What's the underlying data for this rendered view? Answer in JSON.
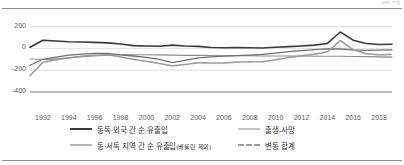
{
  "unit_note": "(단위: 천 명)",
  "chart_data": {
    "type": "line",
    "title": "",
    "xlabel": "",
    "ylabel": "",
    "ylim": [
      -400,
      260
    ],
    "xlim": [
      1991,
      2019
    ],
    "grid": true,
    "legend_position": "bottom",
    "yticks": [
      200,
      0,
      -200,
      -400
    ],
    "ytick_labels": [
      "200",
      "0",
      "-200",
      "-400"
    ],
    "xticks": [
      1992,
      1994,
      1996,
      1998,
      2000,
      2002,
      2004,
      2006,
      2008,
      2010,
      2012,
      2014,
      2016,
      2018
    ],
    "xtick_labels": [
      "1992",
      "1994",
      "1996",
      "1998",
      "2000",
      "2002",
      "2004",
      "2006",
      "2008",
      "2010",
      "2012",
      "2014",
      "2016",
      "2018"
    ],
    "x": [
      1991,
      1992,
      1993,
      1994,
      1995,
      1996,
      1997,
      1998,
      1999,
      2000,
      2001,
      2002,
      2003,
      2004,
      2005,
      2006,
      2007,
      2008,
      2009,
      2010,
      2011,
      2012,
      2013,
      2014,
      2015,
      2016,
      2017,
      2018,
      2019
    ],
    "series": [
      {
        "name": "동독·외국 간 순 유출입",
        "color": "#3a3a3a",
        "style": "solid",
        "width": 1.6,
        "values": [
          10,
          75,
          68,
          60,
          58,
          55,
          50,
          40,
          25,
          22,
          20,
          30,
          22,
          18,
          8,
          5,
          8,
          6,
          4,
          10,
          16,
          22,
          30,
          45,
          150,
          75,
          45,
          35,
          38
        ]
      },
      {
        "name": "출생-사망",
        "color": "#8c8c8c",
        "style": "solid",
        "width": 1.1,
        "values": [
          -98,
          -102,
          -96,
          -86,
          -76,
          -70,
          -62,
          -58,
          -58,
          -58,
          -60,
          -62,
          -64,
          -64,
          -66,
          -68,
          -68,
          -68,
          -70,
          -70,
          -70,
          -70,
          -72,
          -72,
          -72,
          -74,
          -76,
          -78,
          -80
        ]
      },
      {
        "name": "동·서독 지역 간 순 유출입(베를린 제외)",
        "color": "#6f6f6f",
        "style": "solid",
        "width": 1.3,
        "values": [
          -155,
          -100,
          -80,
          -62,
          -52,
          -46,
          -46,
          -60,
          -70,
          -82,
          -100,
          -130,
          -110,
          -88,
          -78,
          -72,
          -66,
          -62,
          -56,
          -44,
          -30,
          -20,
          -12,
          -4,
          -6,
          -14,
          -18,
          -16,
          -14
        ]
      },
      {
        "name": "변동 합계",
        "color": "#9a9a9a",
        "style": "dashed",
        "width": 1.6,
        "values": [
          -250,
          -128,
          -104,
          -88,
          -72,
          -62,
          -58,
          -78,
          -100,
          -118,
          -138,
          -160,
          -148,
          -132,
          -134,
          -134,
          -126,
          -124,
          -122,
          -104,
          -84,
          -68,
          -54,
          -31,
          72,
          -13,
          -49,
          -59,
          -56
        ]
      }
    ]
  },
  "legend": {
    "rows": [
      [
        {
          "label": "동독·외국 간 순 유출입",
          "series_index": 0
        },
        {
          "label": "출생-사망",
          "series_index": 1
        }
      ],
      [
        {
          "label": "동·서독 지역 간 순 유출입(베를린 제외)",
          "series_index": 2
        },
        {
          "label": "변동 합계",
          "series_index": 3
        }
      ]
    ]
  }
}
